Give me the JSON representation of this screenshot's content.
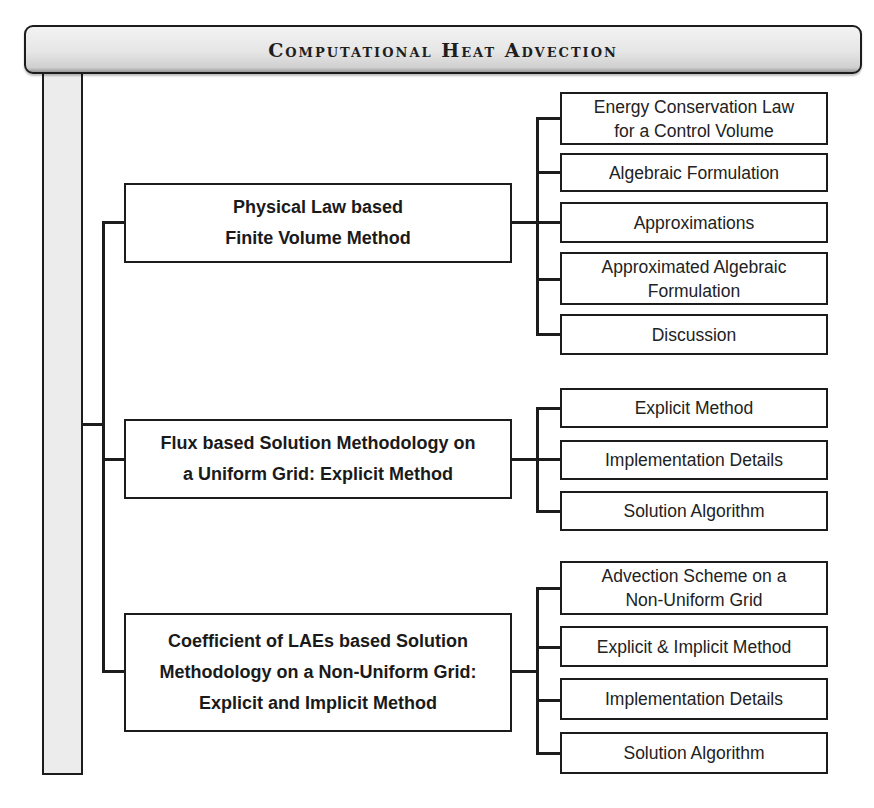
{
  "title": "Computational Heat Advection",
  "branches": [
    {
      "label": "Physical Law based\nFinite Volume Method",
      "children": [
        "Energy Conservation Law\nfor a Control Volume",
        "Algebraic Formulation",
        "Approximations",
        "Approximated Algebraic\nFormulation",
        "Discussion"
      ]
    },
    {
      "label": "Flux based Solution Methodology on\na Uniform Grid: Explicit Method",
      "children": [
        "Explicit Method",
        "Implementation Details",
        "Solution Algorithm"
      ]
    },
    {
      "label": "Coefficient of LAEs based Solution\nMethodology on a Non-Uniform Grid:\nExplicit and Implicit Method",
      "children": [
        "Advection Scheme on a\nNon-Uniform Grid",
        "Explicit & Implicit Method",
        "Implementation Details",
        "Solution Algorithm"
      ]
    }
  ],
  "colors": {
    "stroke": "#1c1c1c",
    "title_bar_fill": "#e6e6e6",
    "spine_fill": "#ececec",
    "box_fill": "#ffffff"
  }
}
